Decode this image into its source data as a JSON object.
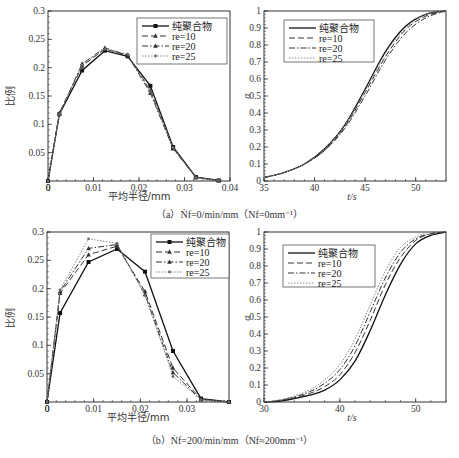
{
  "chart_data": [
    {
      "id": "a_left",
      "type": "line",
      "title": "",
      "xlabel": "平均半径/mm",
      "ylabel": "比例",
      "xlim": [
        0,
        0.04
      ],
      "ylim": [
        0,
        0.3
      ],
      "xticks": [
        "0",
        "0.01",
        "0.02",
        "0.03",
        "0.04"
      ],
      "yticks": [
        "0.05",
        "0.1",
        "0.15",
        "0.2",
        "0.25",
        "0.3"
      ],
      "legend_position": "upper right",
      "x": [
        0,
        0.0025,
        0.0075,
        0.0125,
        0.0175,
        0.0225,
        0.0275,
        0.0325,
        0.0375
      ],
      "series": [
        {
          "name": "纯聚合物",
          "values": [
            0,
            0.118,
            0.195,
            0.23,
            0.22,
            0.168,
            0.06,
            0.007,
            0.001
          ]
        },
        {
          "name": "re=10",
          "values": [
            0,
            0.12,
            0.203,
            0.233,
            0.222,
            0.16,
            0.058,
            0.007,
            0.001
          ]
        },
        {
          "name": "re=20",
          "values": [
            0,
            0.119,
            0.207,
            0.235,
            0.222,
            0.155,
            0.057,
            0.006,
            0.001
          ]
        },
        {
          "name": "re=25",
          "values": [
            0,
            0.118,
            0.205,
            0.233,
            0.224,
            0.158,
            0.059,
            0.006,
            0.001
          ]
        }
      ]
    },
    {
      "id": "a_right",
      "type": "line",
      "title": "",
      "xlabel": "t/s",
      "ylabel": "α",
      "xlim": [
        35,
        53
      ],
      "ylim": [
        0,
        1
      ],
      "xticks": [
        "35",
        "40",
        "45",
        "50"
      ],
      "yticks": [
        "0",
        "0.1",
        "0.2",
        "0.3",
        "0.4",
        "0.5",
        "0.6",
        "0.7",
        "0.8",
        "0.9",
        "1"
      ],
      "legend_position": "upper left",
      "x": [
        35,
        37,
        39,
        41,
        43,
        45,
        47,
        49,
        51,
        53
      ],
      "series": [
        {
          "name": "纯聚合物",
          "values": [
            0.02,
            0.05,
            0.1,
            0.19,
            0.33,
            0.54,
            0.76,
            0.91,
            0.98,
            1.0
          ]
        },
        {
          "name": "re=10",
          "values": [
            0.02,
            0.05,
            0.1,
            0.18,
            0.32,
            0.52,
            0.73,
            0.89,
            0.97,
            1.0
          ]
        },
        {
          "name": "re=20",
          "values": [
            0.02,
            0.05,
            0.1,
            0.18,
            0.31,
            0.5,
            0.71,
            0.87,
            0.96,
            1.0
          ]
        },
        {
          "name": "re=25",
          "values": [
            0.02,
            0.05,
            0.1,
            0.19,
            0.33,
            0.53,
            0.75,
            0.9,
            0.98,
            1.0
          ]
        }
      ]
    },
    {
      "id": "b_left",
      "type": "line",
      "title": "",
      "xlabel": "平均半径/mm",
      "ylabel": "比例",
      "xlim": [
        0,
        0.039
      ],
      "ylim": [
        0,
        0.3
      ],
      "xticks": [
        "0",
        "0.01",
        "0.02",
        "0.03"
      ],
      "yticks": [
        "0.05",
        "0.1",
        "0.15",
        "0.2",
        "0.25",
        "0.3"
      ],
      "legend_position": "upper right",
      "x": [
        0,
        0.0028,
        0.0089,
        0.015,
        0.021,
        0.027,
        0.033,
        0.039
      ],
      "series": [
        {
          "name": "纯聚合物",
          "values": [
            0,
            0.157,
            0.247,
            0.27,
            0.23,
            0.09,
            0.006,
            0.0
          ]
        },
        {
          "name": "re=10",
          "values": [
            0,
            0.192,
            0.26,
            0.275,
            0.195,
            0.06,
            0.005,
            0.0
          ]
        },
        {
          "name": "re=20",
          "values": [
            0,
            0.195,
            0.271,
            0.278,
            0.19,
            0.052,
            0.004,
            0.0
          ]
        },
        {
          "name": "re=25",
          "values": [
            0,
            0.198,
            0.288,
            0.28,
            0.188,
            0.045,
            0.004,
            0.0
          ]
        }
      ]
    },
    {
      "id": "b_right",
      "type": "line",
      "title": "",
      "xlabel": "t/s",
      "ylabel": "α",
      "xlim": [
        30,
        54
      ],
      "ylim": [
        0,
        1
      ],
      "xticks": [
        "30",
        "40",
        "50"
      ],
      "yticks": [
        "0",
        "0.1",
        "0.2",
        "0.3",
        "0.4",
        "0.5",
        "0.6",
        "0.7",
        "0.8",
        "0.9",
        "1"
      ],
      "legend_position": "upper left",
      "x": [
        30,
        32,
        34,
        36,
        38,
        40,
        42,
        44,
        46,
        48,
        50,
        52,
        54
      ],
      "series": [
        {
          "name": "纯聚合物",
          "values": [
            0.0,
            0.005,
            0.02,
            0.04,
            0.07,
            0.13,
            0.24,
            0.42,
            0.63,
            0.81,
            0.93,
            0.98,
            1.0
          ]
        },
        {
          "name": "re=10",
          "values": [
            0.0,
            0.008,
            0.025,
            0.05,
            0.09,
            0.16,
            0.29,
            0.48,
            0.69,
            0.85,
            0.95,
            0.99,
            1.0
          ]
        },
        {
          "name": "re=20",
          "values": [
            0.0,
            0.01,
            0.03,
            0.06,
            0.11,
            0.19,
            0.33,
            0.53,
            0.73,
            0.88,
            0.96,
            0.99,
            1.0
          ]
        },
        {
          "name": "re=25",
          "values": [
            0.0,
            0.012,
            0.035,
            0.07,
            0.13,
            0.22,
            0.37,
            0.57,
            0.77,
            0.91,
            0.97,
            1.0,
            1.0
          ]
        }
      ]
    }
  ],
  "captions": {
    "a": "（a）Ṅf=0/min/mm（Nf=0mm⁻¹）",
    "b": "（b）Ṅf=200/min/mm（Nf≈200mm⁻¹）"
  },
  "legend": [
    "纯聚合物",
    "re=10",
    "re=20",
    "re=25"
  ]
}
